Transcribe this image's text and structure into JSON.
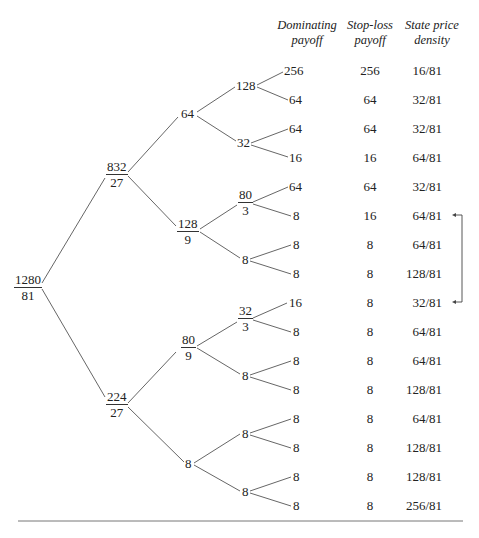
{
  "headers": {
    "dominating": [
      "Dominating",
      "payoff"
    ],
    "stoploss": [
      "Stop-loss",
      "payoff"
    ],
    "spd": [
      "State price",
      "density"
    ]
  },
  "tree": {
    "root": {
      "num": "1280",
      "den": "81"
    },
    "level1": [
      {
        "num": "832",
        "den": "27"
      },
      {
        "num": "224",
        "den": "27"
      }
    ],
    "level2": [
      {
        "value": "64"
      },
      {
        "num": "128",
        "den": "9"
      },
      {
        "num": "80",
        "den": "9"
      },
      {
        "value": "8"
      }
    ],
    "level3": [
      {
        "value": "128"
      },
      {
        "value": "32"
      },
      {
        "num": "80",
        "den": "3"
      },
      {
        "value": "8"
      },
      {
        "num": "32",
        "den": "3"
      },
      {
        "value": "8"
      },
      {
        "value": "8"
      },
      {
        "value": "8"
      }
    ]
  },
  "rows": [
    {
      "dominating": "256",
      "stoploss": "256",
      "spd": "16/81"
    },
    {
      "dominating": "64",
      "stoploss": "64",
      "spd": "32/81"
    },
    {
      "dominating": "64",
      "stoploss": "64",
      "spd": "32/81"
    },
    {
      "dominating": "16",
      "stoploss": "16",
      "spd": "64/81"
    },
    {
      "dominating": "64",
      "stoploss": "64",
      "spd": "32/81"
    },
    {
      "dominating": "8",
      "stoploss": "16",
      "spd": "64/81"
    },
    {
      "dominating": "8",
      "stoploss": "8",
      "spd": "64/81"
    },
    {
      "dominating": "8",
      "stoploss": "8",
      "spd": "128/81"
    },
    {
      "dominating": "16",
      "stoploss": "8",
      "spd": "32/81"
    },
    {
      "dominating": "8",
      "stoploss": "8",
      "spd": "64/81"
    },
    {
      "dominating": "8",
      "stoploss": "8",
      "spd": "64/81"
    },
    {
      "dominating": "8",
      "stoploss": "8",
      "spd": "128/81"
    },
    {
      "dominating": "8",
      "stoploss": "8",
      "spd": "64/81"
    },
    {
      "dominating": "8",
      "stoploss": "8",
      "spd": "128/81"
    },
    {
      "dominating": "8",
      "stoploss": "8",
      "spd": "128/81"
    },
    {
      "dominating": "8",
      "stoploss": "8",
      "spd": "256/81"
    }
  ],
  "bracket": {
    "from_row": 6,
    "to_row": 9,
    "meaning": "swap arrow between 64/81 and 32/81"
  },
  "colors": {
    "line": "#555555",
    "text": "#222222",
    "rule": "#777777"
  }
}
